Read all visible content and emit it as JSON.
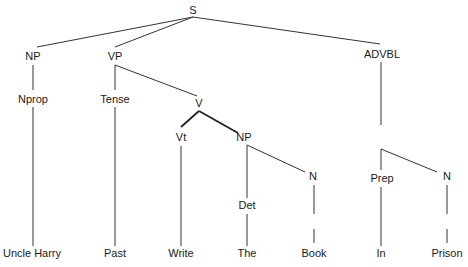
{
  "diagram": {
    "type": "syntax-tree",
    "colors": {
      "line": "#333333",
      "text": "#1a1a1a",
      "background": "#ffffff"
    },
    "nodes": [
      {
        "id": "S",
        "label": "S",
        "x": 193,
        "y": 14
      },
      {
        "id": "NP1",
        "label": "NP",
        "x": 33,
        "y": 60
      },
      {
        "id": "VP",
        "label": "VP",
        "x": 115,
        "y": 60
      },
      {
        "id": "ADVBL",
        "label": "ADVBL",
        "x": 382,
        "y": 58
      },
      {
        "id": "Nprop",
        "label": "Nprop",
        "x": 33,
        "y": 103
      },
      {
        "id": "Tense",
        "label": "Tense",
        "x": 115,
        "y": 103
      },
      {
        "id": "V",
        "label": "V",
        "x": 199,
        "y": 107
      },
      {
        "id": "Vt",
        "label": "Vt",
        "x": 181,
        "y": 141
      },
      {
        "id": "NP2",
        "label": "NP",
        "x": 244,
        "y": 141
      },
      {
        "id": "Det",
        "label": "Det",
        "x": 247,
        "y": 209
      },
      {
        "id": "N1",
        "label": "N",
        "x": 313,
        "y": 180
      },
      {
        "id": "Prep",
        "label": "Prep",
        "x": 382,
        "y": 182
      },
      {
        "id": "N2",
        "label": "N",
        "x": 447,
        "y": 180
      },
      {
        "id": "w1",
        "label": "Uncle Harry",
        "x": 32,
        "y": 257
      },
      {
        "id": "w2",
        "label": "Past",
        "x": 115,
        "y": 257
      },
      {
        "id": "w3",
        "label": "Write",
        "x": 181,
        "y": 257
      },
      {
        "id": "w4",
        "label": "The",
        "x": 247,
        "y": 257
      },
      {
        "id": "w5",
        "label": "Book",
        "x": 314,
        "y": 257
      },
      {
        "id": "w6",
        "label": "In",
        "x": 381,
        "y": 257
      },
      {
        "id": "w7",
        "label": "Prison",
        "x": 447,
        "y": 257
      }
    ],
    "edges": [
      {
        "from": "S",
        "to": "NP1",
        "x1": 193,
        "y1": 17,
        "x2": 37,
        "y2": 47
      },
      {
        "from": "S",
        "to": "VP",
        "x1": 193,
        "y1": 17,
        "x2": 115,
        "y2": 47
      },
      {
        "from": "S",
        "to": "ADVBL",
        "x1": 193,
        "y1": 17,
        "x2": 380,
        "y2": 44
      },
      {
        "from": "NP1",
        "to": "Nprop",
        "x1": 33,
        "y1": 65,
        "x2": 33,
        "y2": 90
      },
      {
        "from": "VP",
        "to": "Tense",
        "x1": 115,
        "y1": 65,
        "x2": 115,
        "y2": 90
      },
      {
        "from": "VP",
        "to": "V",
        "x1": 115,
        "y1": 65,
        "x2": 197,
        "y2": 96
      },
      {
        "from": "V",
        "to": "Vt",
        "x1": 199,
        "y1": 111,
        "x2": 181,
        "y2": 127,
        "bold": true
      },
      {
        "from": "V",
        "to": "NP2",
        "x1": 199,
        "y1": 111,
        "x2": 238,
        "y2": 133,
        "bold": true
      },
      {
        "from": "Nprop",
        "to": "w1",
        "x1": 33,
        "y1": 107,
        "x2": 33,
        "y2": 246
      },
      {
        "from": "Tense",
        "to": "w2",
        "x1": 115,
        "y1": 107,
        "x2": 115,
        "y2": 246
      },
      {
        "from": "Vt",
        "to": "w3",
        "x1": 181,
        "y1": 146,
        "x2": 181,
        "y2": 246
      },
      {
        "from": "NP2",
        "to": "Det",
        "x1": 247,
        "y1": 145,
        "x2": 247,
        "y2": 198
      },
      {
        "from": "NP2",
        "to": "N1",
        "x1": 247,
        "y1": 145,
        "x2": 305,
        "y2": 172
      },
      {
        "from": "Det",
        "to": "w4",
        "x1": 247,
        "y1": 214,
        "x2": 247,
        "y2": 246
      },
      {
        "from": "N1",
        "to": "w5",
        "x1": 314,
        "y1": 185,
        "x2": 314,
        "y2": 214
      },
      {
        "from": "N1",
        "to": "w5b",
        "x1": 314,
        "y1": 229,
        "x2": 314,
        "y2": 243
      },
      {
        "from": "ADVBL",
        "to": "PP",
        "x1": 381,
        "y1": 62,
        "x2": 381,
        "y2": 125
      },
      {
        "from": "PP",
        "to": "Prep",
        "x1": 381,
        "y1": 149,
        "x2": 381,
        "y2": 170
      },
      {
        "from": "PP",
        "to": "N2",
        "x1": 381,
        "y1": 149,
        "x2": 437,
        "y2": 172
      },
      {
        "from": "Prep",
        "to": "w6",
        "x1": 381,
        "y1": 187,
        "x2": 381,
        "y2": 246
      },
      {
        "from": "N2",
        "to": "w7",
        "x1": 447,
        "y1": 185,
        "x2": 447,
        "y2": 214
      },
      {
        "from": "N2",
        "to": "w7b",
        "x1": 447,
        "y1": 229,
        "x2": 447,
        "y2": 243
      }
    ]
  }
}
